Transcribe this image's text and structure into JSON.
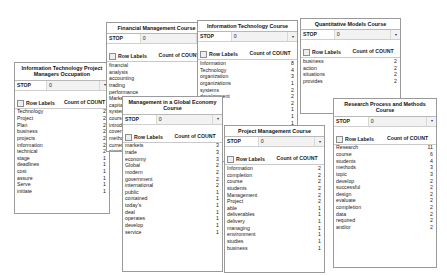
{
  "common": {
    "filter_label": "STOP",
    "filter_value": "0",
    "dropdown_icon": "chevron-down-icon",
    "row_labels_header": "Row Labels",
    "count_header": "Count of COUNT"
  },
  "panels": [
    {
      "id": "itpm",
      "title": "Information Technology Project Managers Occupation",
      "rows": [
        {
          "label": "Technology",
          "value": "2"
        },
        {
          "label": "Project",
          "value": "2"
        },
        {
          "label": "Plan",
          "value": "2"
        },
        {
          "label": "business",
          "value": "2"
        },
        {
          "label": "projects",
          "value": "2"
        },
        {
          "label": "information",
          "value": "2"
        },
        {
          "label": "technical",
          "value": "2"
        },
        {
          "label": "stage",
          "value": "1"
        },
        {
          "label": "deadlines",
          "value": "1"
        },
        {
          "label": "cost",
          "value": "1"
        },
        {
          "label": "assure",
          "value": "1"
        },
        {
          "label": "Serve",
          "value": "1"
        },
        {
          "label": "initiate",
          "value": "1"
        }
      ]
    },
    {
      "id": "fin",
      "title": "Financial Management Course",
      "rows": [
        {
          "label": "financial",
          "value": "4"
        },
        {
          "label": "analysis",
          "value": "3"
        },
        {
          "label": "accounting",
          "value": "2"
        },
        {
          "label": "trading",
          "value": "1"
        },
        {
          "label": "performance",
          "value": "1"
        },
        {
          "label": "Markets",
          "value": "1"
        },
        {
          "label": "capital",
          "value": "1"
        },
        {
          "label": "systems",
          "value": "1"
        },
        {
          "label": "course",
          "value": "1"
        },
        {
          "label": "introduces",
          "value": "1"
        },
        {
          "label": "covers",
          "value": "1"
        },
        {
          "label": "methods",
          "value": "1"
        },
        {
          "label": "currency",
          "value": "1"
        },
        {
          "label": "signals",
          "value": "1"
        }
      ]
    },
    {
      "id": "itc",
      "title": "Information Technology Course",
      "rows": [
        {
          "label": "Information",
          "value": "8"
        },
        {
          "label": "Technology",
          "value": "4"
        },
        {
          "label": "organization",
          "value": "3"
        },
        {
          "label": "organizations",
          "value": "1"
        },
        {
          "label": "systems",
          "value": "2"
        },
        {
          "label": "development",
          "value": "2"
        },
        {
          "label": "makes",
          "value": "2"
        },
        {
          "label": "strategic",
          "value": "1"
        },
        {
          "label": "Data",
          "value": "1"
        },
        {
          "label": "planning",
          "value": "1"
        },
        {
          "label": "roles",
          "value": "1"
        },
        {
          "label": "course",
          "value": "1"
        }
      ]
    },
    {
      "id": "quant",
      "title": "Quantitative Models Course",
      "rows": [
        {
          "label": "business",
          "value": "2"
        },
        {
          "label": "action",
          "value": "2"
        },
        {
          "label": "situations",
          "value": "2"
        },
        {
          "label": "provides",
          "value": "2"
        }
      ]
    },
    {
      "id": "glob",
      "title": "Management in a Global Economy Course",
      "rows": [
        {
          "label": "markets",
          "value": "3"
        },
        {
          "label": "trade",
          "value": "3"
        },
        {
          "label": "economy",
          "value": "3"
        },
        {
          "label": "Global",
          "value": "2"
        },
        {
          "label": "modern",
          "value": "2"
        },
        {
          "label": "government",
          "value": "2"
        },
        {
          "label": "international",
          "value": "2"
        },
        {
          "label": "public",
          "value": "1"
        },
        {
          "label": "contained",
          "value": "1"
        },
        {
          "label": "today's",
          "value": "1"
        },
        {
          "label": "deal",
          "value": "1"
        },
        {
          "label": "operates",
          "value": "1"
        },
        {
          "label": "develop",
          "value": "1"
        },
        {
          "label": "service",
          "value": "1"
        }
      ]
    },
    {
      "id": "pmc",
      "title": "Project Management Course",
      "rows": [
        {
          "label": "Information",
          "value": "2"
        },
        {
          "label": "completion",
          "value": "2"
        },
        {
          "label": "course",
          "value": "2"
        },
        {
          "label": "students",
          "value": "2"
        },
        {
          "label": "Management",
          "value": "2"
        },
        {
          "label": "Project",
          "value": "2"
        },
        {
          "label": "able",
          "value": "1"
        },
        {
          "label": "deliverables",
          "value": "1"
        },
        {
          "label": "delivery",
          "value": "1"
        },
        {
          "label": "managing",
          "value": "1"
        },
        {
          "label": "environment",
          "value": "1"
        },
        {
          "label": "studies",
          "value": "1"
        },
        {
          "label": "business",
          "value": "1"
        }
      ]
    },
    {
      "id": "rpm",
      "title": "Research Process and Methods Course",
      "rows": [
        {
          "label": "Research",
          "value": "11"
        },
        {
          "label": "course",
          "value": "6"
        },
        {
          "label": "students",
          "value": "4"
        },
        {
          "label": "methods",
          "value": "3"
        },
        {
          "label": "topic",
          "value": "3"
        },
        {
          "label": "develop",
          "value": "2"
        },
        {
          "label": "successful",
          "value": "2"
        },
        {
          "label": "design",
          "value": "2"
        },
        {
          "label": "evaluate",
          "value": "2"
        },
        {
          "label": "completion",
          "value": "2"
        },
        {
          "label": "data",
          "value": "2"
        },
        {
          "label": "required",
          "value": "2"
        },
        {
          "label": "and/or",
          "value": "2"
        }
      ]
    }
  ]
}
